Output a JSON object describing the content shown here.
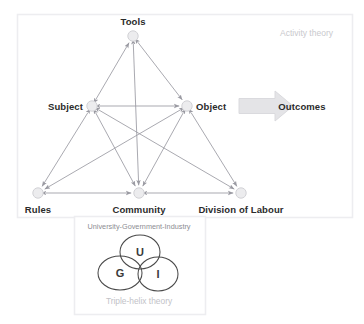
{
  "canvas": {
    "width": 364,
    "height": 324,
    "background": "#ffffff"
  },
  "colors": {
    "panel_border": "#ededf0",
    "edge": "#9a9aa2",
    "node_fill": "#ececee",
    "node_stroke": "#d2d2d6",
    "label_text": "#2b2b2b",
    "soft_text": "#c9c9cd",
    "helix_title_text": "#8d8d93",
    "helix_caption_text": "#c2c2c7",
    "arrow_fill": "#e4e4e7",
    "arrow_stroke": "#dadade",
    "venn_stroke": "#4a4a4a"
  },
  "activity_panel": {
    "title": "Activity theory",
    "title_pos": {
      "x": 333,
      "y": 33
    },
    "bounds": {
      "x": 17,
      "y": 14,
      "w": 335,
      "h": 203
    }
  },
  "nodes": [
    {
      "id": "tools",
      "label": "Tools",
      "x": 133,
      "y": 36,
      "r": 5.2,
      "label_pos": {
        "x": 133,
        "y": 21
      },
      "anchor": "center"
    },
    {
      "id": "subject",
      "label": "Subject",
      "x": 92,
      "y": 106,
      "r": 5.2,
      "label_pos": {
        "x": 83,
        "y": 106
      },
      "anchor": "left"
    },
    {
      "id": "object",
      "label": "Object",
      "x": 187,
      "y": 106,
      "r": 5.2,
      "label_pos": {
        "x": 196,
        "y": 106
      },
      "anchor": "right"
    },
    {
      "id": "rules",
      "label": "Rules",
      "x": 38,
      "y": 193,
      "r": 5.2,
      "label_pos": {
        "x": 38,
        "y": 209
      },
      "anchor": "center"
    },
    {
      "id": "community",
      "label": "Community",
      "x": 139,
      "y": 193,
      "r": 5.2,
      "label_pos": {
        "x": 139,
        "y": 209
      },
      "anchor": "center"
    },
    {
      "id": "division",
      "label": "Division of Labour",
      "x": 241,
      "y": 193,
      "r": 5.2,
      "label_pos": {
        "x": 241,
        "y": 209
      },
      "anchor": "center"
    }
  ],
  "edges": [
    {
      "from": "subject",
      "to": "tools",
      "arrows": "both"
    },
    {
      "from": "tools",
      "to": "object",
      "arrows": "both"
    },
    {
      "from": "subject",
      "to": "object",
      "arrows": "both"
    },
    {
      "from": "tools",
      "to": "community",
      "arrows": "both"
    },
    {
      "from": "subject",
      "to": "rules",
      "arrows": "both"
    },
    {
      "from": "object",
      "to": "division",
      "arrows": "both"
    },
    {
      "from": "rules",
      "to": "community",
      "arrows": "both"
    },
    {
      "from": "community",
      "to": "division",
      "arrows": "both"
    },
    {
      "from": "subject",
      "to": "community",
      "arrows": "both"
    },
    {
      "from": "subject",
      "to": "division",
      "arrows": "both"
    },
    {
      "from": "object",
      "to": "community",
      "arrows": "both"
    },
    {
      "from": "object",
      "to": "rules",
      "arrows": "both"
    }
  ],
  "outcomes": {
    "label": "Outcomes",
    "label_pos": {
      "x": 302,
      "y": 106
    },
    "arrow": {
      "x": 239,
      "y": 106,
      "length": 54,
      "shaft_h": 15,
      "head_w": 18,
      "head_h": 30
    }
  },
  "triple_helix": {
    "box": {
      "x": 74,
      "y": 216,
      "w": 131,
      "h": 98
    },
    "title": "University-Government-Industry",
    "title_pos": {
      "x": 139,
      "y": 222
    },
    "caption": "Triple-helix theory",
    "caption_pos": {
      "x": 139,
      "y": 296
    },
    "circles": [
      {
        "id": "university",
        "letter": "U",
        "cx": 140,
        "cy": 252,
        "rx": 20,
        "ry": 17
      },
      {
        "id": "government",
        "letter": "G",
        "cx": 120,
        "cy": 273,
        "rx": 22,
        "ry": 17
      },
      {
        "id": "industry",
        "letter": "I",
        "cx": 158,
        "cy": 274,
        "rx": 20,
        "ry": 17
      }
    ]
  }
}
